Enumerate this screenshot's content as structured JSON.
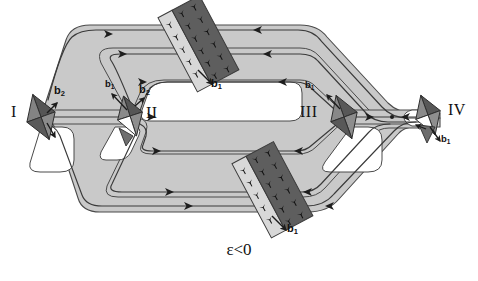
{
  "figure": {
    "caption": "ε<0",
    "caption_x": 224,
    "caption_y": 243,
    "background": "#ffffff",
    "band_fill": "#c9c9c9",
    "band_stroke": "#4a4a4a",
    "track_stroke": "#3a3a3a",
    "diamond_dark": "#4f4f4f",
    "diamond_mid": "#7d7d7d",
    "diamond_light": "#9a9a9a",
    "wall_dark": "#606060",
    "wall_light": "#d6d6d6",
    "symbol_color": "#1a1a1a"
  },
  "nodes": [
    {
      "id": "I",
      "label": "I",
      "label_x": 12,
      "label_y": 105,
      "kind": "source-diamond",
      "cx": 41,
      "cy": 117
    },
    {
      "id": "II",
      "label": "II",
      "label_x": 148,
      "label_y": 106,
      "kind": "source-diamond",
      "cx": 130,
      "cy": 116
    },
    {
      "id": "III",
      "label": "III",
      "label_x": 302,
      "label_y": 105,
      "kind": "source-diamond",
      "cx": 344,
      "cy": 117
    },
    {
      "id": "IV",
      "label": "IV",
      "label_x": 449,
      "label_y": 103,
      "kind": "source-diamond",
      "cx": 428,
      "cy": 115
    }
  ],
  "walls": [
    {
      "id": "wall-top",
      "cx": 198,
      "cy": 44,
      "label": "b",
      "sub": "1",
      "label_x": 213,
      "label_y": 83
    },
    {
      "id": "wall-bottom",
      "cx": 272,
      "cy": 190,
      "label": "b",
      "sub": "1",
      "label_x": 288,
      "label_y": 228
    }
  ],
  "burgers_labels": [
    {
      "id": "b2-node-I",
      "text": "b",
      "sub": "2",
      "x": 51,
      "y": 92,
      "size": "large"
    },
    {
      "id": "b1-node-II",
      "text": "b",
      "sub": "1",
      "x": 108,
      "y": 85,
      "size": "small"
    },
    {
      "id": "b2-node-II",
      "text": "b",
      "sub": "2",
      "x": 140,
      "y": 90,
      "size": "large"
    },
    {
      "id": "b1-node-III",
      "text": "b",
      "sub": "1",
      "x": 309,
      "y": 86,
      "size": "small"
    },
    {
      "id": "b1-node-IV",
      "text": "b",
      "sub": "1",
      "x": 443,
      "y": 136,
      "size": "small"
    },
    {
      "id": "b1-wall-top",
      "text": "b",
      "sub": "1",
      "x": 213,
      "y": 80,
      "size": "large"
    },
    {
      "id": "b1-wall-bot",
      "text": "b",
      "sub": "1",
      "x": 288,
      "y": 225,
      "size": "large"
    }
  ],
  "flow_arrows": [
    {
      "id": "arrow-top-outer",
      "x": 112,
      "y": 33,
      "dir": "right"
    },
    {
      "id": "arrow-top-mid",
      "x": 126,
      "y": 53,
      "dir": "right"
    },
    {
      "id": "arrow-top-inner",
      "x": 146,
      "y": 73,
      "dir": "right"
    },
    {
      "id": "arrow-top-r1",
      "x": 258,
      "y": 31,
      "dir": "left"
    },
    {
      "id": "arrow-top-r2",
      "x": 268,
      "y": 53,
      "dir": "left"
    },
    {
      "id": "arrow-top-r3",
      "x": 283,
      "y": 74,
      "dir": "left"
    },
    {
      "id": "arrow-bot-l1",
      "x": 160,
      "y": 164,
      "dir": "right"
    },
    {
      "id": "arrow-bot-l2",
      "x": 172,
      "y": 187,
      "dir": "right"
    },
    {
      "id": "arrow-bot-l3",
      "x": 191,
      "y": 210,
      "dir": "right"
    },
    {
      "id": "arrow-bot-r1",
      "x": 303,
      "y": 164,
      "dir": "left"
    },
    {
      "id": "arrow-bot-r2",
      "x": 312,
      "y": 187,
      "dir": "left"
    },
    {
      "id": "arrow-bot-r3",
      "x": 331,
      "y": 210,
      "dir": "left"
    },
    {
      "id": "arrow-center-l",
      "x": 147,
      "y": 117,
      "dir": "right"
    },
    {
      "id": "arrow-center-r",
      "x": 367,
      "y": 117,
      "dir": "right"
    },
    {
      "id": "arrow-center-r2",
      "x": 404,
      "y": 117,
      "dir": "left"
    }
  ]
}
